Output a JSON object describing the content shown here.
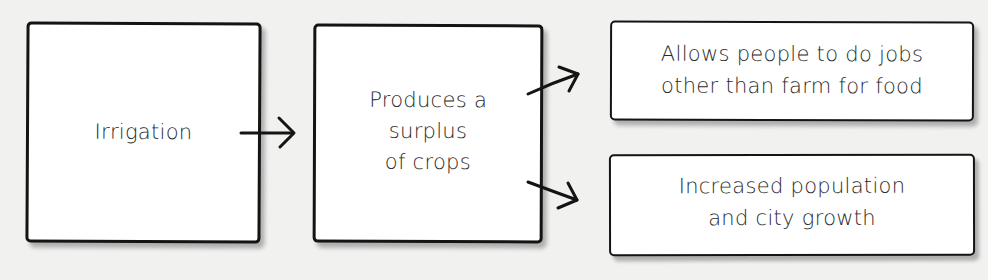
{
  "diagram": {
    "type": "flowchart",
    "nodes": [
      {
        "id": "irrigation",
        "label": "Irrigation"
      },
      {
        "id": "surplus",
        "label": "Produces a\nsurplus\nof crops"
      },
      {
        "id": "jobs",
        "label": "Allows people to do jobs\nother than farm for food"
      },
      {
        "id": "growth",
        "label": "Increased population\nand city growth"
      }
    ],
    "edges": [
      {
        "from": "irrigation",
        "to": "surplus"
      },
      {
        "from": "surplus",
        "to": "jobs"
      },
      {
        "from": "surplus",
        "to": "growth"
      }
    ],
    "colors": {
      "stroke": "#141414",
      "box_fill": "#ffffff",
      "background": "#f1f1f0",
      "text": "#2a2a2a"
    }
  }
}
